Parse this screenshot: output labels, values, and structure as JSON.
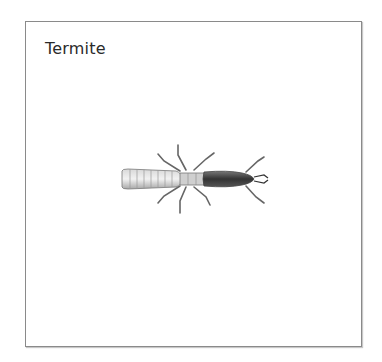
{
  "card": {
    "title": "Termite",
    "image": {
      "subject": "termite-illustration",
      "style": "grayscale engraving"
    },
    "border_color": "#8a8a8a"
  }
}
